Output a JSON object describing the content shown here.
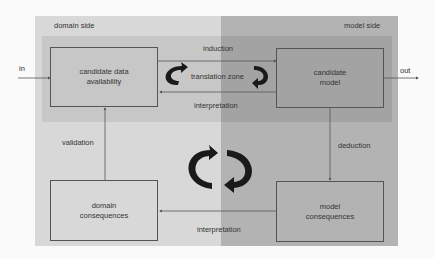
{
  "diagram": {
    "regions": {
      "domain_side": "domain side",
      "model_side": "model side",
      "translation_zone": "translation zone"
    },
    "boxes": {
      "candidate_data": [
        "candidate data",
        "availability"
      ],
      "candidate_model": [
        "candidate",
        "model"
      ],
      "domain_consequences": [
        "domain",
        "consequences"
      ],
      "model_consequences": [
        "model",
        "consequences"
      ]
    },
    "edges": {
      "in": "in",
      "out": "out",
      "induction": "induction",
      "interpretation_top": "interpretation",
      "deduction": "deduction",
      "interpretation_bottom": "interpretation",
      "validation": "validation"
    },
    "colors": {
      "domain_bg": "#d8d8d8",
      "model_bg": "#b3b3b3",
      "band_domain": "#c7c7c7",
      "band_model": "#a3a3a3",
      "line": "#555555",
      "arrow": "#1a1a1a"
    }
  }
}
